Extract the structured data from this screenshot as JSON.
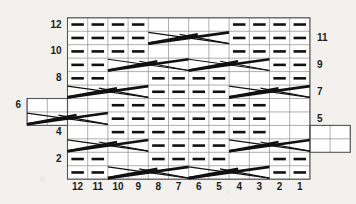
{
  "chart_data": {
    "type": "table",
    "title": "",
    "xlabel": "",
    "ylabel": "",
    "columns": 12,
    "rows": 12,
    "column_labels": [
      "12",
      "11",
      "10",
      "9",
      "8",
      "7",
      "6",
      "5",
      "4",
      "3",
      "2",
      "1"
    ],
    "row_labels_left": [
      "12",
      "10",
      "8",
      "6",
      "4",
      "2"
    ],
    "row_labels_right": [
      "11",
      "9",
      "7",
      "5",
      "3",
      "1"
    ],
    "grid": true,
    "legend": "",
    "start_marker": "←",
    "cells": [
      {
        "row": 12,
        "type": "purl",
        "cols": [
          12,
          11,
          10,
          9
        ]
      },
      {
        "row": 12,
        "type": "blank",
        "cols": [
          8,
          7,
          6,
          5
        ]
      },
      {
        "row": 12,
        "type": "purl",
        "cols": [
          4,
          3,
          2,
          1
        ]
      },
      {
        "row": 11,
        "type": "purl",
        "cols": [
          12,
          11,
          10,
          9
        ]
      },
      {
        "row": 11,
        "type": "cable",
        "span": [
          8,
          5
        ]
      },
      {
        "row": 11,
        "type": "purl",
        "cols": [
          4,
          3,
          2,
          1
        ]
      },
      {
        "row": 10,
        "type": "purl",
        "cols": [
          12,
          11,
          10,
          9
        ]
      },
      {
        "row": 10,
        "type": "blank",
        "cols": [
          8,
          7,
          6,
          5
        ]
      },
      {
        "row": 10,
        "type": "purl",
        "cols": [
          4,
          3,
          2,
          1
        ]
      },
      {
        "row": 9,
        "type": "purl",
        "cols": [
          12,
          11
        ]
      },
      {
        "row": 9,
        "type": "cable",
        "span": [
          10,
          7
        ]
      },
      {
        "row": 9,
        "type": "cable",
        "span": [
          6,
          3
        ]
      },
      {
        "row": 9,
        "type": "purl",
        "cols": [
          2,
          1
        ]
      },
      {
        "row": 8,
        "type": "purl",
        "cols": [
          12,
          11
        ]
      },
      {
        "row": 8,
        "type": "blank",
        "cols": [
          10,
          9
        ]
      },
      {
        "row": 8,
        "type": "purl",
        "cols": [
          8,
          7,
          6,
          5
        ]
      },
      {
        "row": 8,
        "type": "blank",
        "cols": [
          4,
          3
        ]
      },
      {
        "row": 8,
        "type": "purl",
        "cols": [
          2,
          1
        ]
      },
      {
        "row": 7,
        "type": "cable",
        "span": [
          12,
          9
        ]
      },
      {
        "row": 7,
        "type": "purl",
        "cols": [
          8,
          7,
          6,
          5
        ]
      },
      {
        "row": 7,
        "type": "cable",
        "span": [
          4,
          1
        ]
      },
      {
        "row": 6,
        "type": "blank",
        "cols": [
          14,
          13,
          12,
          11
        ]
      },
      {
        "row": 6,
        "type": "purl",
        "cols": [
          10,
          9,
          8,
          7,
          6,
          5,
          4,
          3
        ]
      },
      {
        "row": 6,
        "type": "blank",
        "cols": [
          2,
          1
        ]
      },
      {
        "row": 5,
        "type": "cable",
        "span": [
          14,
          11
        ]
      },
      {
        "row": 5,
        "type": "purl",
        "cols": [
          10,
          9,
          8,
          7,
          6,
          5,
          4,
          3
        ]
      },
      {
        "row": 5,
        "type": "blank",
        "cols": [
          2,
          1
        ]
      },
      {
        "row": 4,
        "type": "blank",
        "cols": [
          12,
          11
        ]
      },
      {
        "row": 4,
        "type": "purl",
        "cols": [
          10,
          9,
          8,
          7,
          6,
          5,
          4,
          3
        ]
      },
      {
        "row": 4,
        "type": "blank",
        "cols": [
          2,
          1,
          0,
          -1
        ]
      },
      {
        "row": 3,
        "type": "cable",
        "span": [
          12,
          9
        ]
      },
      {
        "row": 3,
        "type": "purl",
        "cols": [
          8,
          7,
          6,
          5
        ]
      },
      {
        "row": 3,
        "type": "cable",
        "span": [
          4,
          1
        ]
      },
      {
        "row": 3,
        "type": "blank",
        "cols": [
          0,
          -1
        ]
      },
      {
        "row": 2,
        "type": "purl",
        "cols": [
          12,
          11
        ]
      },
      {
        "row": 2,
        "type": "blank",
        "cols": [
          10,
          9
        ]
      },
      {
        "row": 2,
        "type": "purl",
        "cols": [
          8,
          7,
          6,
          5
        ]
      },
      {
        "row": 2,
        "type": "blank",
        "cols": [
          4,
          3
        ]
      },
      {
        "row": 2,
        "type": "purl",
        "cols": [
          2,
          1
        ]
      },
      {
        "row": 1,
        "type": "purl",
        "cols": [
          12,
          11
        ]
      },
      {
        "row": 1,
        "type": "cable",
        "span": [
          10,
          7
        ]
      },
      {
        "row": 1,
        "type": "cable",
        "span": [
          6,
          3
        ]
      },
      {
        "row": 1,
        "type": "purl",
        "cols": [
          2,
          1
        ]
      }
    ]
  },
  "geometry": {
    "grid_left": 67.5,
    "grid_top": 17.8,
    "col_width": 20.2,
    "row_height": 13.45,
    "cols": 12,
    "rows": 12,
    "left_ext_cols": 2,
    "left_ext_rows": [
      6,
      5
    ],
    "right_ext_cols": 2,
    "right_ext_rows": [
      4,
      3
    ]
  },
  "colors": {
    "background": "#f2f1ee",
    "grid_line": "#8d8d8d",
    "border": "#555555",
    "symbol": "#111111",
    "label": "#1c1c1c"
  }
}
